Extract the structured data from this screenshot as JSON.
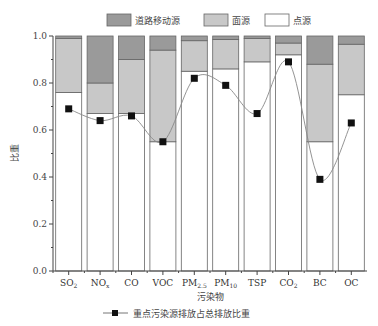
{
  "chart_data": {
    "type": "bar",
    "stacked": true,
    "title": "",
    "xlabel": "污染物",
    "ylabel": "比重",
    "ylim": [
      0.0,
      1.0
    ],
    "yticks": [
      "0.0",
      "0.2",
      "0.4",
      "0.6",
      "0.8",
      "1.0"
    ],
    "categories": [
      "SO2",
      "NOx",
      "CO",
      "VOC",
      "PM2.5",
      "PM10",
      "TSP",
      "CO2",
      "BC",
      "OC"
    ],
    "category_labels": [
      {
        "main": "SO",
        "sub": "2"
      },
      {
        "main": "NO",
        "sub": "x"
      },
      {
        "main": "CO",
        "sub": ""
      },
      {
        "main": "VOC",
        "sub": ""
      },
      {
        "main": "PM",
        "sub": "2.5"
      },
      {
        "main": "PM",
        "sub": "10"
      },
      {
        "main": "TSP",
        "sub": ""
      },
      {
        "main": "CO",
        "sub": "2"
      },
      {
        "main": "BC",
        "sub": ""
      },
      {
        "main": "OC",
        "sub": ""
      }
    ],
    "series": [
      {
        "name": "点源",
        "color": "#ffffff",
        "values": [
          0.76,
          0.67,
          0.67,
          0.55,
          0.85,
          0.86,
          0.89,
          0.92,
          0.55,
          0.75
        ]
      },
      {
        "name": "面源",
        "color": "#c8c8c8",
        "values": [
          0.23,
          0.13,
          0.23,
          0.39,
          0.13,
          0.125,
          0.1,
          0.05,
          0.33,
          0.215
        ]
      },
      {
        "name": "道路移动源",
        "color": "#9a9a9a",
        "values": [
          0.01,
          0.2,
          0.1,
          0.06,
          0.02,
          0.015,
          0.01,
          0.03,
          0.12,
          0.035
        ]
      }
    ],
    "line_series": {
      "name": "重点污染源排放占总排放比重",
      "type": "line",
      "marker": "square",
      "smooth": true,
      "values": [
        0.69,
        0.64,
        0.66,
        0.55,
        0.82,
        0.79,
        0.67,
        0.89,
        0.39,
        0.63
      ]
    },
    "legend": {
      "position": "top",
      "entries": [
        "道路移动源",
        "面源",
        "点源"
      ]
    },
    "bottom_legend": {
      "position": "bottom",
      "entries": [
        "重点污染源排放占总排放比重"
      ]
    },
    "grid": false
  }
}
